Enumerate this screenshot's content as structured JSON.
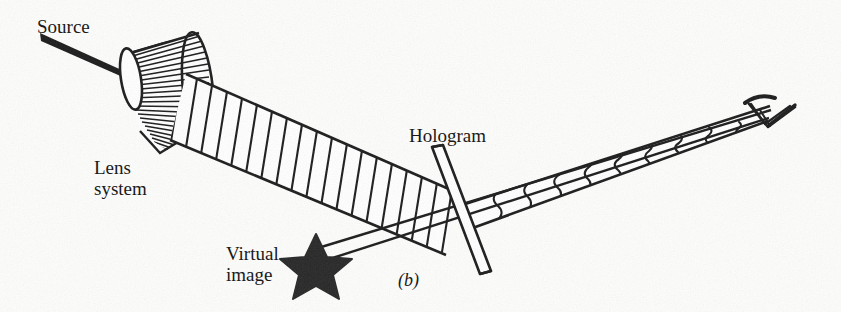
{
  "figure": {
    "panel_label": "(b)",
    "domain": "optics-diagram",
    "labels": {
      "source": "Source",
      "lens_system": "Lens\nsystem",
      "hologram": "Hologram",
      "virtual_image": "Virtual\nimage"
    },
    "icons": {
      "eye": "eye-icon",
      "star": "star-icon",
      "source_ray": "source-ray-icon",
      "lens_cone": "lens-cone-icon",
      "hologram_plate": "hologram-plate-icon",
      "plane_wavefronts": "plane-wavefront-icon",
      "distorted_wavefronts": "distorted-wavefront-icon"
    },
    "colors": {
      "ink": "#1a1a1a",
      "paper": "#fdfdfc",
      "star_fill": "#262626"
    },
    "counts": {
      "plane_wavefronts": 18,
      "distorted_wavefronts": 9,
      "lens_cone_rays": 26,
      "star_points": 5
    }
  }
}
